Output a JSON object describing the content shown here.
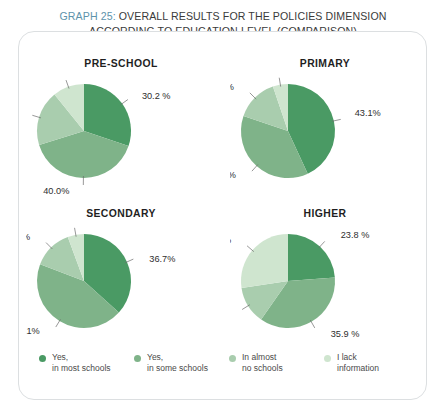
{
  "title": {
    "graph_number": "GRAPH 25:",
    "line1_rest": " OVERALL RESULTS FOR THE POLICIES DIMENSION",
    "line2": "ACCORDING TO EDUCATION LEVEL (COMPARISON)",
    "accent_color": "#5d93ab"
  },
  "legend": {
    "items": [
      {
        "label_line1": "Yes,",
        "label_line2": "in most schools",
        "color": "#4a9a64"
      },
      {
        "label_line1": "Yes,",
        "label_line2": "in some schools",
        "color": "#7fb389"
      },
      {
        "label_line1": "In almost",
        "label_line2": "no schools",
        "color": "#a9cdae"
      },
      {
        "label_line1": "I lack",
        "label_line2": "information",
        "color": "#cfe5cf"
      }
    ]
  },
  "chart_data": {
    "type": "pie",
    "title": "GRAPH 25: OVERALL RESULTS FOR THE POLICIES DIMENSION ACCORDING TO EDUCATION LEVEL (COMPARISON)",
    "legend_position": "bottom",
    "categories": [
      "Yes, in most schools",
      "Yes, in some schools",
      "In almost no schools",
      "I lack information"
    ],
    "colors": [
      "#4a9a64",
      "#7fb389",
      "#a9cdae",
      "#cfe5cf"
    ],
    "units": "percent",
    "charts": [
      {
        "title": "PRE-SCHOOL",
        "values": [
          30.2,
          40.0,
          19.0,
          10.8
        ],
        "labels": [
          "30.2 %",
          "40.0%",
          "19.0 %",
          "10.8 %"
        ]
      },
      {
        "title": "PRIMARY",
        "values": [
          43.1,
          37.1,
          14.6,
          5.2
        ],
        "labels": [
          "43.1%",
          "37.1%",
          "14.6 %",
          "5.2 %"
        ]
      },
      {
        "title": "SECONDARY",
        "values": [
          36.7,
          44.1,
          13.6,
          5.6
        ],
        "labels": [
          "36.7%",
          "44.1%",
          "13.6 %",
          "5.6 %"
        ]
      },
      {
        "title": "HIGHER",
        "values": [
          23.8,
          35.9,
          12.9,
          27.4
        ],
        "labels": [
          "23.8 %",
          "35.9 %",
          "12.9 %",
          "27.4 %"
        ]
      }
    ]
  }
}
